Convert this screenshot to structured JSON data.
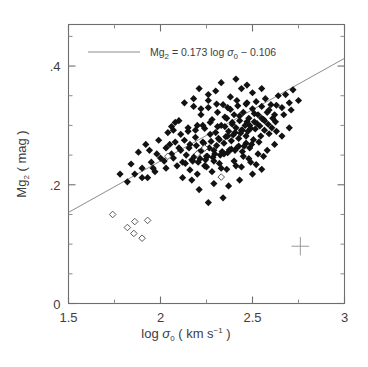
{
  "figure": {
    "background": "#ffffff",
    "frame_color": "#6e6e6e",
    "marker_color": "#121212",
    "line_color": "#8c8c8c"
  },
  "legend": {
    "equation_parts": {
      "symbol": "Mg",
      "symbol_sub": "2",
      "equals": " = 0.173  log ",
      "sigma": "σ",
      "sigma_sub": "0",
      "minus": "  −  0.106"
    },
    "equation_text": "Mg2 = 0.173 log σ0 − 0.106"
  },
  "axes": {
    "x": {
      "label_parts": {
        "log": "log ",
        "sigma": "σ",
        "sigma_sub": "0",
        "units_open": "  (  km  s",
        "units_exp": "−1",
        "units_close": "  )"
      },
      "label_text": "log σ0 ( km s-1 )",
      "ticks": [
        "1.5",
        "2",
        "2.5",
        "3"
      ],
      "tick_values": [
        1.5,
        2.0,
        2.5,
        3.0
      ],
      "minor_tick_values": [
        1.75,
        2.25,
        2.75
      ],
      "range": [
        1.5,
        3.0
      ]
    },
    "y": {
      "label_parts": {
        "symbol": "Mg",
        "symbol_sub": "2",
        "units": "  (  mag  )"
      },
      "label_text": "Mg2 ( mag )",
      "ticks": [
        "0",
        ".2",
        ".4"
      ],
      "tick_values": [
        0.0,
        0.2,
        0.4
      ],
      "minor_tick_values": [
        0.05,
        0.1,
        0.15,
        0.25,
        0.3,
        0.35,
        0.45
      ],
      "range": [
        0.0,
        0.47
      ]
    }
  },
  "chart_data": {
    "type": "scatter",
    "title": "",
    "xlabel": "log σ0 ( km s−1 )",
    "ylabel": "Mg2 ( mag )",
    "xlim": [
      1.5,
      3.0
    ],
    "ylim": [
      0.0,
      0.47
    ],
    "grid": false,
    "legend_position": "top-left",
    "fit": {
      "slope": 0.173,
      "intercept": -0.106,
      "label": "Mg2 = 0.173 log σ0 − 0.106",
      "x_endpoints": [
        1.5,
        3.0
      ],
      "y_endpoints": [
        0.1535,
        0.413
      ]
    },
    "error_cross": {
      "x": 2.76,
      "y": 0.0965,
      "x_half_width": 0.048,
      "y_half_height": 0.0155
    },
    "series": [
      {
        "name": "Elliptical galaxies (filled diamonds)",
        "marker": "filled-diamond",
        "points": [
          [
            2.08,
            0.305
          ],
          [
            2.15,
            0.29
          ],
          [
            2.18,
            0.332
          ],
          [
            2.2,
            0.3
          ],
          [
            2.22,
            0.318
          ],
          [
            2.24,
            0.295
          ],
          [
            2.26,
            0.33
          ],
          [
            2.28,
            0.31
          ],
          [
            2.3,
            0.288
          ],
          [
            2.31,
            0.322
          ],
          [
            2.33,
            0.3
          ],
          [
            2.34,
            0.335
          ],
          [
            2.35,
            0.298
          ],
          [
            2.36,
            0.312
          ],
          [
            2.37,
            0.29
          ],
          [
            2.38,
            0.327
          ],
          [
            2.39,
            0.305
          ],
          [
            2.4,
            0.318
          ],
          [
            2.41,
            0.296
          ],
          [
            2.42,
            0.333
          ],
          [
            2.43,
            0.308
          ],
          [
            2.44,
            0.292
          ],
          [
            2.45,
            0.322
          ],
          [
            2.46,
            0.3
          ],
          [
            2.47,
            0.338
          ],
          [
            2.48,
            0.312
          ],
          [
            2.49,
            0.295
          ],
          [
            2.5,
            0.328
          ],
          [
            2.51,
            0.306
          ],
          [
            2.52,
            0.34
          ],
          [
            2.53,
            0.318
          ],
          [
            2.54,
            0.299
          ],
          [
            2.55,
            0.332
          ],
          [
            2.56,
            0.31
          ],
          [
            2.57,
            0.345
          ],
          [
            2.58,
            0.322
          ],
          [
            2.6,
            0.335
          ],
          [
            2.62,
            0.318
          ],
          [
            2.64,
            0.35
          ],
          [
            2.66,
            0.33
          ],
          [
            2.68,
            0.352
          ],
          [
            2.7,
            0.338
          ],
          [
            2.72,
            0.36
          ],
          [
            2.75,
            0.342
          ],
          [
            1.98,
            0.252
          ],
          [
            2.02,
            0.24
          ],
          [
            2.05,
            0.268
          ],
          [
            2.07,
            0.245
          ],
          [
            2.1,
            0.262
          ],
          [
            2.12,
            0.238
          ],
          [
            2.13,
            0.275
          ],
          [
            2.14,
            0.25
          ],
          [
            2.16,
            0.268
          ],
          [
            2.17,
            0.242
          ],
          [
            2.19,
            0.28
          ],
          [
            2.21,
            0.255
          ],
          [
            2.23,
            0.272
          ],
          [
            2.25,
            0.248
          ],
          [
            2.27,
            0.285
          ],
          [
            2.29,
            0.258
          ],
          [
            2.32,
            0.276
          ],
          [
            2.345,
            0.252
          ],
          [
            2.365,
            0.282
          ],
          [
            2.385,
            0.26
          ],
          [
            2.405,
            0.288
          ],
          [
            2.425,
            0.265
          ],
          [
            2.445,
            0.292
          ],
          [
            2.465,
            0.27
          ],
          [
            2.485,
            0.3
          ],
          [
            2.505,
            0.276
          ],
          [
            2.525,
            0.303
          ],
          [
            2.545,
            0.282
          ],
          [
            2.565,
            0.308
          ],
          [
            2.59,
            0.286
          ],
          [
            2.61,
            0.312
          ],
          [
            2.63,
            0.29
          ],
          [
            1.82,
            0.205
          ],
          [
            1.86,
            0.218
          ],
          [
            1.9,
            0.228
          ],
          [
            1.93,
            0.212
          ],
          [
            1.95,
            0.238
          ],
          [
            1.97,
            0.222
          ],
          [
            2.0,
            0.245
          ],
          [
            2.03,
            0.228
          ],
          [
            2.06,
            0.252
          ],
          [
            2.09,
            0.232
          ],
          [
            2.11,
            0.258
          ],
          [
            2.135,
            0.236
          ],
          [
            2.155,
            0.262
          ],
          [
            2.175,
            0.24
          ],
          [
            2.195,
            0.266
          ],
          [
            2.215,
            0.244
          ],
          [
            2.235,
            0.27
          ],
          [
            2.255,
            0.248
          ],
          [
            2.275,
            0.273
          ],
          [
            2.295,
            0.252
          ],
          [
            2.315,
            0.278
          ],
          [
            2.335,
            0.256
          ],
          [
            2.355,
            0.281
          ],
          [
            2.375,
            0.259
          ],
          [
            2.395,
            0.284
          ],
          [
            2.415,
            0.262
          ],
          [
            2.435,
            0.287
          ],
          [
            2.455,
            0.265
          ],
          [
            2.475,
            0.29
          ],
          [
            2.495,
            0.268
          ],
          [
            2.515,
            0.294
          ],
          [
            2.535,
            0.272
          ],
          [
            2.12,
            0.212
          ],
          [
            2.16,
            0.225
          ],
          [
            2.2,
            0.218
          ],
          [
            2.24,
            0.232
          ],
          [
            2.28,
            0.222
          ],
          [
            2.32,
            0.236
          ],
          [
            2.36,
            0.226
          ],
          [
            2.4,
            0.24
          ],
          [
            2.44,
            0.23
          ],
          [
            2.48,
            0.244
          ],
          [
            2.52,
            0.234
          ],
          [
            2.56,
            0.248
          ],
          [
            2.18,
            0.345
          ],
          [
            2.26,
            0.352
          ],
          [
            2.3,
            0.358
          ],
          [
            2.38,
            0.348
          ],
          [
            2.44,
            0.362
          ],
          [
            2.5,
            0.355
          ],
          [
            2.33,
            0.372
          ],
          [
            2.47,
            0.368
          ],
          [
            2.13,
            0.338
          ],
          [
            2.21,
            0.362
          ],
          [
            2.41,
            0.378
          ],
          [
            2.55,
            0.362
          ],
          [
            1.88,
            0.255
          ],
          [
            1.92,
            0.268
          ],
          [
            1.78,
            0.218
          ],
          [
            1.84,
            0.235
          ],
          [
            2.04,
            0.288
          ],
          [
            2.08,
            0.272
          ],
          [
            1.99,
            0.275
          ],
          [
            1.94,
            0.258
          ],
          [
            2.62,
            0.268
          ],
          [
            2.66,
            0.282
          ],
          [
            2.7,
            0.296
          ],
          [
            2.58,
            0.258
          ],
          [
            2.43,
            0.208
          ],
          [
            2.37,
            0.198
          ],
          [
            2.29,
            0.202
          ],
          [
            2.21,
            0.192
          ],
          [
            2.5,
            0.218
          ],
          [
            2.55,
            0.226
          ],
          [
            2.34,
            0.178
          ],
          [
            2.26,
            0.17
          ],
          [
            2.185,
            0.248
          ],
          [
            2.205,
            0.238
          ],
          [
            2.225,
            0.258
          ],
          [
            2.245,
            0.242
          ],
          [
            2.265,
            0.262
          ],
          [
            2.285,
            0.246
          ],
          [
            2.305,
            0.266
          ],
          [
            2.325,
            0.25
          ],
          [
            2.345,
            0.27
          ],
          [
            2.365,
            0.254
          ],
          [
            2.385,
            0.274
          ],
          [
            2.405,
            0.258
          ],
          [
            2.425,
            0.278
          ],
          [
            2.445,
            0.256
          ],
          [
            2.465,
            0.282
          ],
          [
            2.485,
            0.262
          ],
          [
            2.27,
            0.305
          ],
          [
            2.31,
            0.298
          ],
          [
            2.35,
            0.314
          ],
          [
            2.39,
            0.302
          ],
          [
            2.43,
            0.316
          ],
          [
            2.47,
            0.306
          ],
          [
            2.51,
            0.32
          ],
          [
            2.55,
            0.312
          ],
          [
            2.23,
            0.3
          ],
          [
            2.19,
            0.292
          ],
          [
            2.15,
            0.296
          ],
          [
            2.11,
            0.285
          ],
          [
            2.07,
            0.292
          ],
          [
            2.03,
            0.262
          ],
          [
            1.96,
            0.228
          ],
          [
            1.9,
            0.212
          ],
          [
            2.59,
            0.326
          ],
          [
            2.63,
            0.334
          ],
          [
            2.67,
            0.318
          ],
          [
            2.71,
            0.326
          ],
          [
            2.41,
            0.232
          ],
          [
            2.45,
            0.248
          ],
          [
            2.49,
            0.238
          ],
          [
            2.53,
            0.252
          ],
          [
            2.33,
            0.228
          ],
          [
            2.29,
            0.24
          ],
          [
            2.25,
            0.23
          ],
          [
            2.17,
            0.208
          ],
          [
            2.565,
            0.292
          ],
          [
            2.585,
            0.302
          ],
          [
            2.605,
            0.296
          ],
          [
            2.625,
            0.306
          ],
          [
            2.305,
            0.336
          ],
          [
            2.365,
            0.33
          ],
          [
            2.415,
            0.342
          ],
          [
            2.465,
            0.336
          ],
          [
            2.22,
            0.328
          ],
          [
            2.26,
            0.342
          ],
          [
            2.1,
            0.308
          ],
          [
            2.06,
            0.298
          ]
        ]
      },
      {
        "name": "Outlier galaxies (open diamonds)",
        "marker": "open-diamond",
        "points": [
          [
            1.74,
            0.15
          ],
          [
            1.82,
            0.128
          ],
          [
            1.86,
            0.138
          ],
          [
            1.855,
            0.118
          ],
          [
            1.9,
            0.11
          ],
          [
            1.93,
            0.14
          ],
          [
            2.33,
            0.213
          ],
          [
            2.04,
            0.248
          ],
          [
            2.24,
            0.262
          ],
          [
            2.2,
            0.252
          ]
        ]
      }
    ]
  }
}
